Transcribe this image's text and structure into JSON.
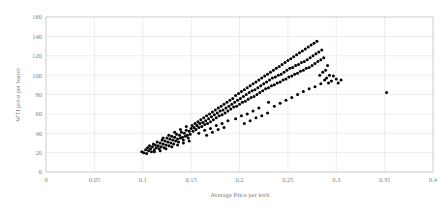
{
  "chart_data": {
    "type": "scatter",
    "title": "",
    "xlabel": "Average Price per kwh",
    "ylabel": "WTI price per barrel",
    "xlim": [
      0,
      0.4
    ],
    "ylim": [
      0,
      160
    ],
    "xticks": [
      "0",
      "0.05",
      "0.1",
      "0.15",
      "0.2",
      "0.25",
      "0.3",
      "0.35",
      "0.4"
    ],
    "xtick_values": [
      0,
      0.05,
      0.1,
      0.15,
      0.2,
      0.25,
      0.3,
      0.35,
      0.4
    ],
    "yticks": [
      "0",
      "20",
      "40",
      "60",
      "80",
      "100",
      "120",
      "140",
      "160"
    ],
    "ytick_values": [
      0,
      20,
      40,
      60,
      80,
      100,
      120,
      140,
      160
    ],
    "grid": true,
    "grid_axes": "both",
    "legend": false,
    "legend_position": "none",
    "marker": {
      "shape": "circle",
      "color": "#000000",
      "size": 3
    },
    "point_count": 232,
    "series": [
      {
        "name": "WTI price per barrel vs Average Price per kwh",
        "color": "#000000",
        "points": [
          [
            0.099,
            21
          ],
          [
            0.101,
            20
          ],
          [
            0.103,
            23
          ],
          [
            0.104,
            19
          ],
          [
            0.105,
            25
          ],
          [
            0.106,
            22
          ],
          [
            0.107,
            27
          ],
          [
            0.108,
            24
          ],
          [
            0.109,
            21
          ],
          [
            0.11,
            26
          ],
          [
            0.111,
            29
          ],
          [
            0.112,
            23
          ],
          [
            0.113,
            28
          ],
          [
            0.114,
            25
          ],
          [
            0.115,
            31
          ],
          [
            0.116,
            27
          ],
          [
            0.117,
            24
          ],
          [
            0.118,
            30
          ],
          [
            0.119,
            26
          ],
          [
            0.12,
            33
          ],
          [
            0.121,
            29
          ],
          [
            0.122,
            25
          ],
          [
            0.123,
            32
          ],
          [
            0.124,
            28
          ],
          [
            0.125,
            35
          ],
          [
            0.126,
            31
          ],
          [
            0.127,
            27
          ],
          [
            0.128,
            34
          ],
          [
            0.129,
            30
          ],
          [
            0.13,
            37
          ],
          [
            0.131,
            33
          ],
          [
            0.132,
            29
          ],
          [
            0.133,
            36
          ],
          [
            0.134,
            32
          ],
          [
            0.135,
            39
          ],
          [
            0.136,
            34
          ],
          [
            0.137,
            31
          ],
          [
            0.138,
            38
          ],
          [
            0.139,
            35
          ],
          [
            0.14,
            41
          ],
          [
            0.141,
            36
          ],
          [
            0.142,
            33
          ],
          [
            0.143,
            40
          ],
          [
            0.144,
            37
          ],
          [
            0.145,
            43
          ],
          [
            0.146,
            38
          ],
          [
            0.147,
            35
          ],
          [
            0.148,
            42
          ],
          [
            0.149,
            39
          ],
          [
            0.15,
            45
          ],
          [
            0.112,
            21
          ],
          [
            0.118,
            22
          ],
          [
            0.124,
            24
          ],
          [
            0.13,
            26
          ],
          [
            0.136,
            28
          ],
          [
            0.142,
            30
          ],
          [
            0.148,
            32
          ],
          [
            0.121,
            35
          ],
          [
            0.127,
            38
          ],
          [
            0.133,
            41
          ],
          [
            0.139,
            44
          ],
          [
            0.145,
            47
          ],
          [
            0.151,
            48
          ],
          [
            0.152,
            42
          ],
          [
            0.153,
            46
          ],
          [
            0.154,
            50
          ],
          [
            0.155,
            44
          ],
          [
            0.156,
            48
          ],
          [
            0.157,
            52
          ],
          [
            0.158,
            46
          ],
          [
            0.159,
            50
          ],
          [
            0.16,
            54
          ],
          [
            0.161,
            47
          ],
          [
            0.162,
            51
          ],
          [
            0.163,
            56
          ],
          [
            0.164,
            49
          ],
          [
            0.165,
            53
          ],
          [
            0.166,
            58
          ],
          [
            0.167,
            50
          ],
          [
            0.168,
            55
          ],
          [
            0.169,
            60
          ],
          [
            0.17,
            52
          ],
          [
            0.171,
            57
          ],
          [
            0.172,
            62
          ],
          [
            0.173,
            54
          ],
          [
            0.174,
            59
          ],
          [
            0.175,
            64
          ],
          [
            0.176,
            56
          ],
          [
            0.177,
            61
          ],
          [
            0.178,
            66
          ],
          [
            0.179,
            58
          ],
          [
            0.18,
            63
          ],
          [
            0.181,
            68
          ],
          [
            0.182,
            59
          ],
          [
            0.183,
            64
          ],
          [
            0.184,
            70
          ],
          [
            0.185,
            61
          ],
          [
            0.186,
            66
          ],
          [
            0.187,
            72
          ],
          [
            0.188,
            63
          ],
          [
            0.158,
            40
          ],
          [
            0.164,
            43
          ],
          [
            0.17,
            45
          ],
          [
            0.176,
            48
          ],
          [
            0.182,
            50
          ],
          [
            0.188,
            53
          ],
          [
            0.166,
            38
          ],
          [
            0.172,
            41
          ],
          [
            0.178,
            44
          ],
          [
            0.184,
            46
          ],
          [
            0.189,
            68
          ],
          [
            0.19,
            74
          ],
          [
            0.191,
            65
          ],
          [
            0.192,
            70
          ],
          [
            0.193,
            76
          ],
          [
            0.194,
            67
          ],
          [
            0.195,
            72
          ],
          [
            0.196,
            79
          ],
          [
            0.197,
            68
          ],
          [
            0.198,
            74
          ],
          [
            0.199,
            81
          ],
          [
            0.2,
            70
          ],
          [
            0.201,
            76
          ],
          [
            0.202,
            83
          ],
          [
            0.203,
            72
          ],
          [
            0.204,
            78
          ],
          [
            0.205,
            85
          ],
          [
            0.206,
            73
          ],
          [
            0.207,
            80
          ],
          [
            0.208,
            87
          ],
          [
            0.209,
            75
          ],
          [
            0.21,
            82
          ],
          [
            0.211,
            89
          ],
          [
            0.212,
            77
          ],
          [
            0.213,
            84
          ],
          [
            0.214,
            91
          ],
          [
            0.215,
            78
          ],
          [
            0.216,
            85
          ],
          [
            0.217,
            93
          ],
          [
            0.218,
            80
          ],
          [
            0.196,
            55
          ],
          [
            0.202,
            58
          ],
          [
            0.208,
            60
          ],
          [
            0.214,
            63
          ],
          [
            0.22,
            66
          ],
          [
            0.205,
            50
          ],
          [
            0.211,
            53
          ],
          [
            0.217,
            56
          ],
          [
            0.223,
            58
          ],
          [
            0.229,
            61
          ],
          [
            0.219,
            87
          ],
          [
            0.22,
            95
          ],
          [
            0.221,
            82
          ],
          [
            0.222,
            89
          ],
          [
            0.223,
            97
          ],
          [
            0.224,
            84
          ],
          [
            0.225,
            91
          ],
          [
            0.226,
            99
          ],
          [
            0.227,
            86
          ],
          [
            0.228,
            93
          ],
          [
            0.229,
            101
          ],
          [
            0.23,
            87
          ],
          [
            0.231,
            95
          ],
          [
            0.232,
            103
          ],
          [
            0.233,
            89
          ],
          [
            0.234,
            97
          ],
          [
            0.235,
            105
          ],
          [
            0.236,
            90
          ],
          [
            0.237,
            98
          ],
          [
            0.238,
            107
          ],
          [
            0.239,
            92
          ],
          [
            0.24,
            100
          ],
          [
            0.241,
            109
          ],
          [
            0.242,
            93
          ],
          [
            0.243,
            101
          ],
          [
            0.244,
            111
          ],
          [
            0.245,
            95
          ],
          [
            0.246,
            103
          ],
          [
            0.247,
            113
          ],
          [
            0.248,
            96
          ],
          [
            0.236,
            68
          ],
          [
            0.242,
            71
          ],
          [
            0.248,
            74
          ],
          [
            0.254,
            77
          ],
          [
            0.23,
            72
          ],
          [
            0.249,
            105
          ],
          [
            0.25,
            115
          ],
          [
            0.251,
            98
          ],
          [
            0.252,
            107
          ],
          [
            0.253,
            117
          ],
          [
            0.254,
            99
          ],
          [
            0.255,
            108
          ],
          [
            0.256,
            119
          ],
          [
            0.257,
            101
          ],
          [
            0.258,
            110
          ],
          [
            0.259,
            121
          ],
          [
            0.26,
            102
          ],
          [
            0.261,
            111
          ],
          [
            0.262,
            123
          ],
          [
            0.263,
            104
          ],
          [
            0.264,
            113
          ],
          [
            0.265,
            125
          ],
          [
            0.266,
            105
          ],
          [
            0.267,
            114
          ],
          [
            0.268,
            127
          ],
          [
            0.269,
            107
          ],
          [
            0.27,
            116
          ],
          [
            0.271,
            129
          ],
          [
            0.272,
            108
          ],
          [
            0.273,
            118
          ],
          [
            0.274,
            131
          ],
          [
            0.275,
            110
          ],
          [
            0.276,
            120
          ],
          [
            0.277,
            133
          ],
          [
            0.278,
            112
          ],
          [
            0.26,
            80
          ],
          [
            0.266,
            83
          ],
          [
            0.272,
            86
          ],
          [
            0.278,
            88
          ],
          [
            0.284,
            91
          ],
          [
            0.279,
            122
          ],
          [
            0.28,
            135
          ],
          [
            0.281,
            114
          ],
          [
            0.282,
            124
          ],
          [
            0.283,
            100
          ],
          [
            0.284,
            116
          ],
          [
            0.285,
            126
          ],
          [
            0.286,
            103
          ],
          [
            0.287,
            118
          ],
          [
            0.288,
            95
          ],
          [
            0.289,
            105
          ],
          [
            0.29,
            97
          ],
          [
            0.291,
            110
          ],
          [
            0.292,
            92
          ],
          [
            0.293,
            100
          ],
          [
            0.295,
            94
          ],
          [
            0.297,
            99
          ],
          [
            0.3,
            96
          ],
          [
            0.302,
            92
          ],
          [
            0.305,
            95
          ],
          [
            0.352,
            82
          ]
        ]
      }
    ]
  },
  "axes": {
    "x_title": "Average Price per kwh",
    "y_title": "WTI price per barrel"
  }
}
